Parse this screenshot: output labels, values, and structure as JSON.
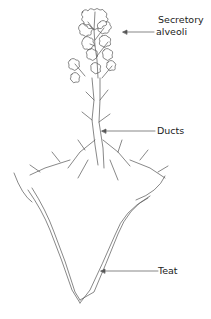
{
  "diagram": {
    "labels": {
      "alveoli_line1": "Secretory",
      "alveoli_line2": "alveoli",
      "ducts": "Ducts",
      "teat": "Teat"
    },
    "colors": {
      "line": "#555555",
      "text": "#222222",
      "background": "#ffffff"
    }
  }
}
